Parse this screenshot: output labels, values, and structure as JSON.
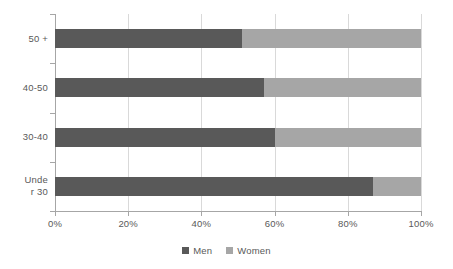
{
  "chart_data": {
    "type": "bar",
    "subtype": "stacked-horizontal-100-percent",
    "title": "",
    "xlabel": "",
    "ylabel": "",
    "categories": [
      "50+",
      "40-50",
      "30-40",
      "Under 30"
    ],
    "category_display": [
      {
        "lines": [
          "50 +"
        ]
      },
      {
        "lines": [
          "40-50"
        ]
      },
      {
        "lines": [
          "30-40"
        ]
      },
      {
        "lines": [
          "Unde",
          "r 30"
        ]
      }
    ],
    "series": [
      {
        "name": "Men",
        "color": "#595959",
        "values": [
          51,
          57,
          60,
          87
        ]
      },
      {
        "name": "Women",
        "color": "#a6a6a6",
        "values": [
          49,
          43,
          40,
          13
        ]
      }
    ],
    "xlim": [
      0,
      100
    ],
    "xticks": [
      0,
      20,
      40,
      60,
      80,
      100
    ],
    "xtick_labels": [
      "0%",
      "20%",
      "40%",
      "60%",
      "80%",
      "100%"
    ],
    "grid": true,
    "grid_axis": "x",
    "legend": {
      "position": "bottom",
      "entries": [
        {
          "label": "Men",
          "color": "#595959"
        },
        {
          "label": "Women",
          "color": "#a6a6a6"
        }
      ]
    }
  },
  "colors": {
    "men": "#595959",
    "women": "#a6a6a6",
    "gridline": "#d9d9d9",
    "axis": "#a6a6a6",
    "text": "#595959",
    "background": "#ffffff"
  }
}
